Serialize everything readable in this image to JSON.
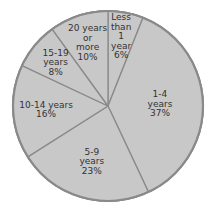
{
  "chart_data": {
    "type": "pie",
    "title": "",
    "start_angle_deg": 0,
    "direction": "clockwise",
    "categories": [
      "Less than 1 year",
      "1-4 years",
      "5-9 years",
      "10-14 years",
      "15-19 years",
      "20 years or more"
    ],
    "values": [
      6,
      37,
      23,
      16,
      8,
      10
    ],
    "unit": "%",
    "slice_labels": [
      [
        "Less",
        "than",
        "1",
        "year",
        "6%"
      ],
      [
        "1-4",
        "years",
        "37%"
      ],
      [
        "5-9",
        "years",
        "23%"
      ],
      [
        "10-14 years",
        "16%"
      ],
      [
        "15-19",
        "years",
        "8%"
      ],
      [
        "20 years",
        "or",
        "more",
        "10%"
      ]
    ],
    "colors": {
      "fill": "#c8c8c8",
      "stroke": "#8a8a8a",
      "text": "#333333"
    },
    "legend": null
  }
}
